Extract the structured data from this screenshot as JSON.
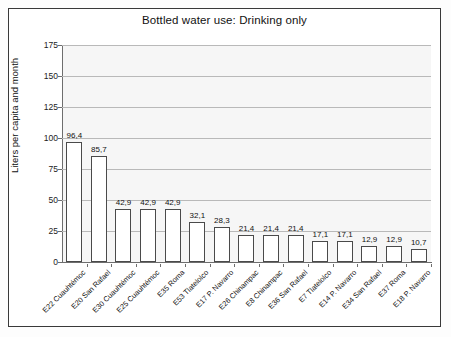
{
  "chart_data": {
    "type": "bar",
    "title": "Bottled water use: Drinking only",
    "xlabel": "",
    "ylabel": "Liters per capita and month",
    "ylim": [
      0,
      175
    ],
    "yticks": [
      0,
      25,
      50,
      75,
      100,
      125,
      150,
      175
    ],
    "ytick_labels": [
      "0",
      "25",
      "50",
      "75",
      "100",
      "125",
      "150",
      "175"
    ],
    "grid": true,
    "legend": "none",
    "decimal_separator": ",",
    "categories": [
      "E22 Cuauhtémoc",
      "E20 San Rafael",
      "E30 Cuauhtémoc",
      "E25 Cuauhtémoc",
      "E35 Roma",
      "E53 Tlatelolco",
      "E17 P. Navarro",
      "E26 Chinampac",
      "E8 Chinampac",
      "E36 San Rafael",
      "E7 Tlatelolco",
      "E14 P. Navarro",
      "E34 San Rafael",
      "E37 Roma",
      "E18 P. Navarro"
    ],
    "values": [
      96.4,
      85.7,
      42.9,
      42.9,
      42.9,
      32.1,
      28.3,
      21.4,
      21.4,
      21.4,
      17.1,
      17.1,
      12.9,
      12.9,
      10.7
    ],
    "value_labels": [
      "96,4",
      "85,7",
      "42,9",
      "42,9",
      "42,9",
      "32,1",
      "28,3",
      "21,4",
      "21,4",
      "21,4",
      "17,1",
      "17,1",
      "12,9",
      "12,9",
      "10,7"
    ],
    "colors": {
      "bar_fill": "#ffffff",
      "bar_edge": "#4a4a4a",
      "plot_background": "#f6f6f6",
      "gridline": "#b9b9b9",
      "axis": "#6e6e6e",
      "frame": "#3a3a3a",
      "text": "#111111"
    }
  }
}
